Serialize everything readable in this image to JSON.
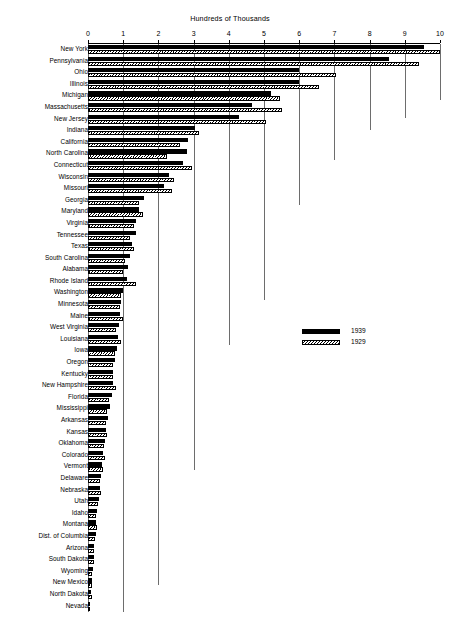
{
  "chart_data": {
    "type": "bar",
    "orientation": "horizontal",
    "title": "Hundreds of Thousands",
    "xlabel": "",
    "ylabel": "",
    "xlim": [
      0,
      10
    ],
    "xticks": [
      0,
      1,
      2,
      3,
      4,
      5,
      6,
      7,
      8,
      9,
      10
    ],
    "xtick_labels": [
      "0",
      "1",
      "2",
      "3",
      "4",
      "5",
      "6",
      "7",
      "8",
      "9",
      "10"
    ],
    "grid": true,
    "grid_axis": "x",
    "legend_position": "middle-right",
    "categories": [
      "New York",
      "Pennsylvania",
      "Ohio",
      "Illinois",
      "Michigan",
      "Massachusetts",
      "New Jersey",
      "Indiana",
      "California",
      "North Carolina",
      "Connecticut",
      "Wisconsin",
      "Missouri",
      "Georgia",
      "Maryland",
      "Virginia",
      "Tennessee",
      "Texas",
      "South Carolina",
      "Alabama",
      "Rhode Island",
      "Washington",
      "Minnesota",
      "Maine",
      "West Virginia",
      "Louisiana",
      "Iowa",
      "Oregon",
      "Kentucky",
      "New Hampshire",
      "Florida",
      "Mississippi",
      "Arkansas",
      "Kansas",
      "Oklahoma",
      "Colorado",
      "Vermont",
      "Delaware",
      "Nebraska",
      "Utah",
      "Idaho",
      "Montana",
      "Dist. of Columbia",
      "Arizona",
      "South Dakota",
      "Wyoming",
      "New Mexico",
      "North Dakota",
      "Nevada"
    ],
    "series": [
      {
        "name": "1939",
        "color": "#000000",
        "pattern": "solid",
        "values": [
          9.55,
          8.55,
          6.0,
          6.0,
          5.2,
          4.65,
          4.3,
          3.05,
          2.85,
          2.8,
          2.7,
          2.3,
          2.15,
          1.6,
          1.45,
          1.35,
          1.35,
          1.25,
          1.2,
          1.15,
          1.1,
          1.0,
          0.95,
          0.9,
          0.88,
          0.85,
          0.82,
          0.78,
          0.72,
          0.7,
          0.68,
          0.62,
          0.58,
          0.52,
          0.48,
          0.42,
          0.4,
          0.38,
          0.34,
          0.3,
          0.26,
          0.24,
          0.22,
          0.18,
          0.16,
          0.13,
          0.11,
          0.09,
          0.07
        ]
      },
      {
        "name": "1929",
        "color": "#000000",
        "pattern": "hatched",
        "values": [
          10.0,
          9.4,
          7.05,
          6.55,
          5.45,
          5.5,
          5.05,
          3.15,
          2.6,
          2.25,
          2.95,
          2.45,
          2.4,
          1.45,
          1.55,
          1.3,
          1.2,
          1.3,
          1.05,
          1.0,
          1.35,
          0.95,
          0.9,
          1.0,
          0.8,
          0.95,
          0.78,
          0.72,
          0.7,
          0.8,
          0.6,
          0.55,
          0.5,
          0.55,
          0.45,
          0.48,
          0.42,
          0.35,
          0.36,
          0.28,
          0.24,
          0.26,
          0.2,
          0.17,
          0.18,
          0.12,
          0.1,
          0.1,
          0.06
        ]
      }
    ],
    "legend": [
      {
        "label": "1939",
        "pattern": "solid"
      },
      {
        "label": "1929",
        "pattern": "hatched"
      }
    ]
  }
}
